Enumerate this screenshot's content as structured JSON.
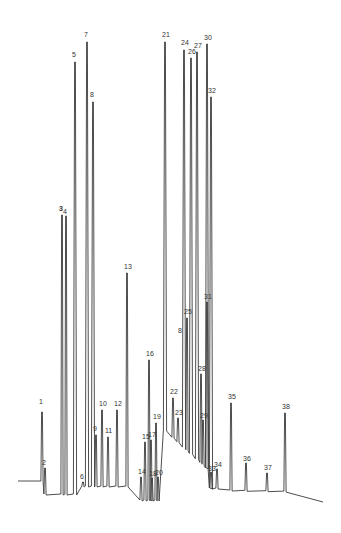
{
  "chart_data": {
    "type": "line",
    "title": "",
    "xlabel": "",
    "ylabel": "",
    "grid": false,
    "legend": null,
    "peaks": [
      {
        "label": "1",
        "x": 42,
        "apex_y": 412,
        "label_y": 405
      },
      {
        "label": "2",
        "x": 45,
        "apex_y": 468,
        "label_y": 466
      },
      {
        "label": "3",
        "x": 62,
        "apex_y": 215,
        "label_y": 212,
        "bold": true
      },
      {
        "label": "4",
        "x": 66,
        "apex_y": 216,
        "label_y": 215
      },
      {
        "label": "5",
        "x": 75,
        "apex_y": 62,
        "label_y": 58
      },
      {
        "label": "6",
        "x": 83,
        "apex_y": 482,
        "label_y": 480
      },
      {
        "label": "7",
        "x": 87,
        "apex_y": 42,
        "label_y": 38
      },
      {
        "label": "8",
        "x": 93,
        "apex_y": 102,
        "label_y": 98
      },
      {
        "label": "9",
        "x": 96,
        "apex_y": 435,
        "label_y": 432
      },
      {
        "label": "10",
        "x": 102,
        "apex_y": 410,
        "label_y": 407
      },
      {
        "label": "11",
        "x": 108,
        "apex_y": 437,
        "label_y": 434
      },
      {
        "label": "12",
        "x": 117,
        "apex_y": 410,
        "label_y": 407
      },
      {
        "label": "13",
        "x": 127,
        "apex_y": 273,
        "label_y": 270
      },
      {
        "label": "14",
        "x": 141,
        "apex_y": 477,
        "label_y": 475
      },
      {
        "label": "15",
        "x": 145,
        "apex_y": 442,
        "label_y": 440
      },
      {
        "label": "16",
        "x": 149,
        "apex_y": 360,
        "label_y": 357
      },
      {
        "label": "17",
        "x": 151,
        "apex_y": 440,
        "label_y": 438
      },
      {
        "label": "18",
        "x": 152,
        "apex_y": 478,
        "label_y": 477
      },
      {
        "label": "19",
        "x": 156,
        "apex_y": 423,
        "label_y": 420
      },
      {
        "label": "20",
        "x": 158,
        "apex_y": 477,
        "label_y": 476
      },
      {
        "label": "21",
        "x": 165,
        "apex_y": 42,
        "label_y": 38
      },
      {
        "label": "22",
        "x": 173,
        "apex_y": 398,
        "label_y": 395
      },
      {
        "label": "23",
        "x": 178,
        "apex_y": 418,
        "label_y": 416
      },
      {
        "label": "24",
        "x": 184,
        "apex_y": 50,
        "label_y": 46
      },
      {
        "label": "25",
        "x": 187,
        "apex_y": 318,
        "label_y": 315
      },
      {
        "label": "26",
        "x": 191,
        "apex_y": 58,
        "label_y": 55
      },
      {
        "label": "27",
        "x": 197,
        "apex_y": 52,
        "label_y": 49
      },
      {
        "label": "28",
        "x": 201,
        "apex_y": 374,
        "label_y": 372
      },
      {
        "label": "29",
        "x": 203,
        "apex_y": 420,
        "label_y": 419
      },
      {
        "label": "30",
        "x": 207,
        "apex_y": 44,
        "label_y": 41
      },
      {
        "label": "31",
        "x": 207,
        "apex_y": 302,
        "label_y": 300
      },
      {
        "label": "32",
        "x": 211,
        "apex_y": 97,
        "label_y": 94
      },
      {
        "label": "33",
        "x": 211,
        "apex_y": 472,
        "label_y": 472
      },
      {
        "label": "34",
        "x": 217,
        "apex_y": 469,
        "label_y": 468
      },
      {
        "label": "35",
        "x": 231,
        "apex_y": 403,
        "label_y": 400
      },
      {
        "label": "36",
        "x": 246,
        "apex_y": 463,
        "label_y": 462
      },
      {
        "label": "37",
        "x": 267,
        "apex_y": 473,
        "label_y": 471
      },
      {
        "label": "38",
        "x": 285,
        "apex_y": 413,
        "label_y": 410
      }
    ],
    "baseline": {
      "y_left": 481,
      "y_right": 502,
      "x_start": 18,
      "x_end": 323
    },
    "annotations": [
      "8 (secondary label near peak 25 at x≈180,y≈330)"
    ]
  }
}
